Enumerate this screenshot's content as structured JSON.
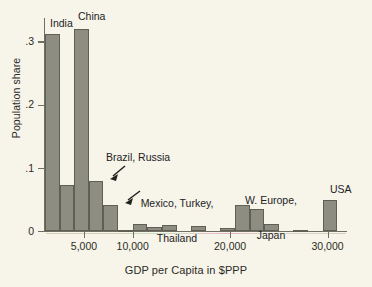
{
  "chart_data": {
    "type": "bar",
    "title": "",
    "subtitle": "",
    "xlabel": "GDP per Capita in $PPP",
    "ylabel": "Population share",
    "xlim": [
      1000,
      32000
    ],
    "ylim": [
      0,
      0.335
    ],
    "grid": false,
    "legend": "none",
    "bin_width": 1500,
    "categories": [
      "1000-2500",
      "2500-4000",
      "4000-5500",
      "5500-7000",
      "7000-8500",
      "8500-10000",
      "10000-11500",
      "11500-13000",
      "13000-14500",
      "14500-16000",
      "16000-17500",
      "17500-19000",
      "19000-20500",
      "20500-22000",
      "22000-23500",
      "23500-25000",
      "25000-26500",
      "26500-28000",
      "28000-29500",
      "29500-31000"
    ],
    "bin_starts": [
      1000,
      2500,
      4000,
      5500,
      7000,
      8500,
      10000,
      11500,
      13000,
      14500,
      16000,
      17500,
      19000,
      20500,
      22000,
      23500,
      25000,
      26500,
      28000,
      29500
    ],
    "values": [
      0.31,
      0.072,
      0.318,
      0.079,
      0.041,
      0.001,
      0.011,
      0.006,
      0.01,
      0.0,
      0.008,
      0.0,
      0.004,
      0.041,
      0.034,
      0.011,
      0.0,
      0.002,
      0.0,
      0.048
    ],
    "xticks": [
      5000,
      10000,
      20000,
      30000
    ],
    "xticklabels": [
      "5,000",
      "10,000",
      "20,000",
      "30,000"
    ],
    "yticks": [
      0,
      0.1,
      0.2,
      0.3
    ],
    "yticklabels": [
      "0",
      ".1",
      ".2",
      ".3"
    ],
    "annotations": [
      {
        "text": "India",
        "bin_index": 0,
        "kind": "label"
      },
      {
        "text": "China",
        "bin_index": 2,
        "kind": "label"
      },
      {
        "text": "Brazil, Russia",
        "bin_index": 3,
        "kind": "arrow"
      },
      {
        "text": "Mexico, Turkey,\nThailand",
        "bin_index": 4,
        "kind": "arrow"
      },
      {
        "text": "W. Europe,\nJapan",
        "bin_index": 13,
        "kind": "label"
      },
      {
        "text": "USA",
        "bin_index": 19,
        "kind": "label"
      }
    ],
    "colors": {
      "bar_fill": "#8d8d82",
      "bar_stroke": "#5f5f55",
      "background": "#f7f4e9",
      "axis": "#6f6f63",
      "text": "#22221d"
    }
  },
  "axes": {
    "y_title": "Population share",
    "x_title": "GDP per Capita in $PPP",
    "y_tick_labels": [
      "0",
      ".1",
      ".2",
      ".3"
    ],
    "x_tick_labels": [
      "5,000",
      "10,000",
      "20,000",
      "30,000"
    ]
  },
  "labels": {
    "india": "India",
    "china": "China",
    "brazil_russia": "Brazil, Russia",
    "mexico_turkey_thailand_line1": "Mexico, Turkey,",
    "mexico_turkey_thailand_line2": "Thailand",
    "weurope_japan_line1": "W. Europe,",
    "weurope_japan_line2": "Japan",
    "usa": "USA"
  }
}
